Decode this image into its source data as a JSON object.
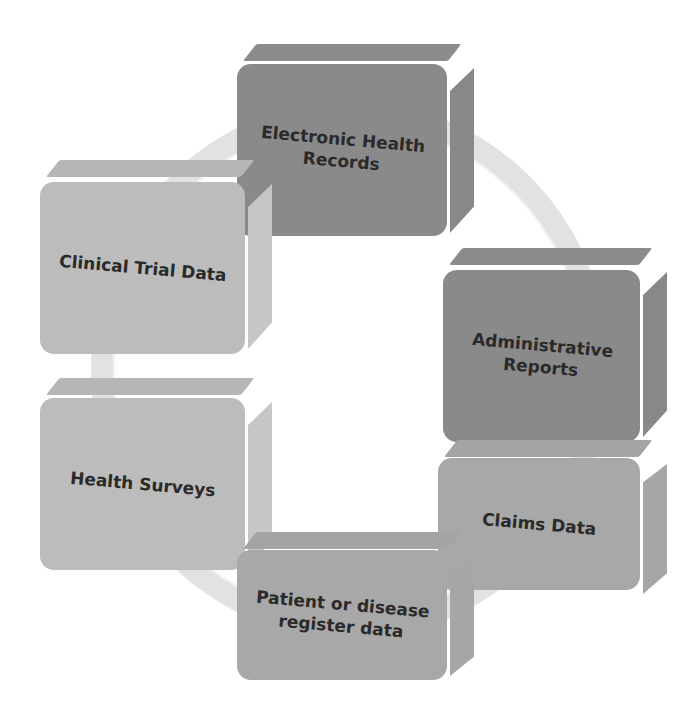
{
  "diagram": {
    "type": "cycle",
    "ring_color": "#e4e4e4",
    "nodes": [
      {
        "id": "ehr",
        "label": "Electronic Health Records",
        "lines": [
          "Electronic Health",
          "Records"
        ],
        "shade": "dark",
        "color": "#8a8a8a"
      },
      {
        "id": "admin",
        "label": "Administrative Reports",
        "lines": [
          "Administrative",
          "Reports"
        ],
        "shade": "dark",
        "color": "#8a8a8a"
      },
      {
        "id": "claims",
        "label": "Claims Data",
        "lines": [
          "Claims Data"
        ],
        "shade": "mid",
        "color": "#a8a8a8"
      },
      {
        "id": "patient",
        "label": "Patient or disease register data",
        "lines": [
          "Patient or disease",
          "register data"
        ],
        "shade": "mid",
        "color": "#a8a8a8"
      },
      {
        "id": "surveys",
        "label": "Health Surveys",
        "lines": [
          "Health Surveys"
        ],
        "shade": "light",
        "color": "#bcbcbc"
      },
      {
        "id": "clinical",
        "label": "Clinical Trial Data",
        "lines": [
          "Clinical Trial Data"
        ],
        "shade": "light",
        "color": "#bcbcbc"
      }
    ]
  }
}
